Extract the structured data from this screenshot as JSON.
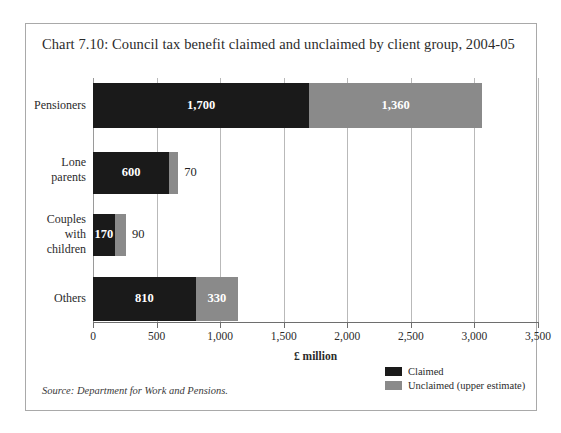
{
  "figure": {
    "title": "Chart 7.10: Council tax benefit claimed and unclaimed by client group, 2004-05",
    "source_note": "Source: Department for Work and Pensions.",
    "border_color": "#a9a9a9",
    "background": "#ffffff"
  },
  "legend": {
    "position": "bottom-right",
    "items": [
      {
        "label": "Claimed",
        "color": "#1a1a1a"
      },
      {
        "label": "Unclaimed (upper estimate)",
        "color": "#8a8a8a"
      }
    ]
  },
  "chart_data": {
    "type": "bar",
    "orientation": "horizontal",
    "stacked": true,
    "title": "Chart 7.10: Council tax benefit claimed and unclaimed by client group, 2004-05",
    "xlabel": "£ million",
    "ylabel": "",
    "xlim": [
      0,
      3500
    ],
    "xticks": [
      0,
      500,
      1000,
      1500,
      2000,
      2500,
      3000,
      3500
    ],
    "xtick_labels": [
      "0",
      "500",
      "1,000",
      "1,500",
      "2,000",
      "2,500",
      "3,000",
      "3,500"
    ],
    "grid": "vertical",
    "categories": [
      "Pensioners",
      "Lone parents",
      "Couples with children",
      "Others"
    ],
    "category_lines": [
      [
        "Pensioners"
      ],
      [
        "Lone",
        "parents"
      ],
      [
        "Couples",
        "with",
        "children"
      ],
      [
        "Others"
      ]
    ],
    "series": [
      {
        "name": "Claimed",
        "color": "#1a1a1a",
        "values": [
          1700,
          600,
          170,
          810
        ],
        "value_labels": [
          "1,700",
          "600",
          "170",
          "810"
        ],
        "label_placement": [
          "inside",
          "inside",
          "inside",
          "inside"
        ]
      },
      {
        "name": "Unclaimed (upper estimate)",
        "color": "#8a8a8a",
        "values": [
          1360,
          70,
          90,
          330
        ],
        "value_labels": [
          "1,360",
          "70",
          "90",
          "330"
        ],
        "label_placement": [
          "inside",
          "outside",
          "outside",
          "inside"
        ]
      }
    ],
    "totals": [
      3060,
      670,
      260,
      1140
    ]
  }
}
